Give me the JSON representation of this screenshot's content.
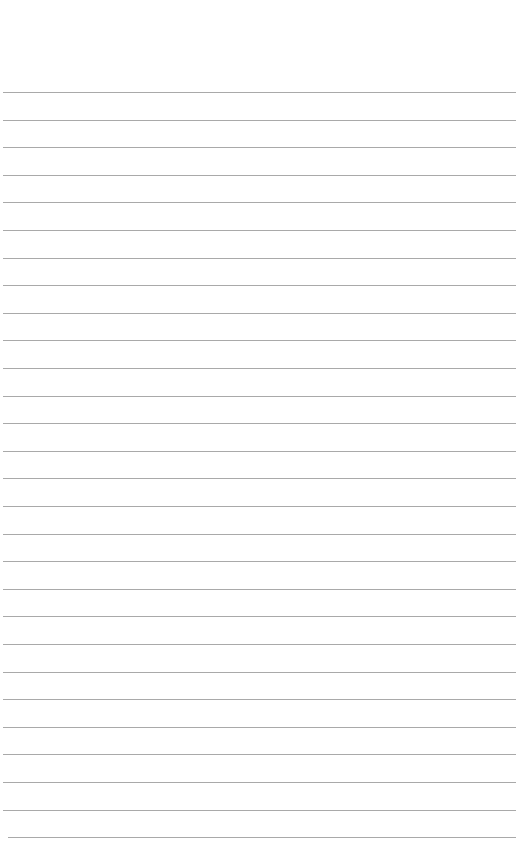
{
  "page": {
    "type": "lined-paper",
    "background": "#ffffff",
    "line_color": "#9a9a9a",
    "line_count": 28,
    "first_line_y": 92,
    "line_spacing": 27.6,
    "line_left": 3,
    "line_right": 516
  }
}
